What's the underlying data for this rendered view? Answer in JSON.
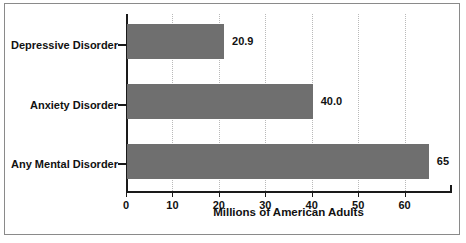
{
  "chart_data": {
    "type": "bar",
    "orientation": "horizontal",
    "title": "",
    "xlabel": "Millions of American Adults",
    "ylabel": "",
    "categories": [
      "Depressive Disorder",
      "Anxiety Disorder",
      "Any Mental Disorder"
    ],
    "values": [
      20.9,
      40.0,
      65
    ],
    "value_labels": [
      "20.9",
      "40.0",
      "65"
    ],
    "xlim": [
      0,
      70
    ],
    "xticks": [
      0,
      10,
      20,
      30,
      40,
      50,
      60
    ],
    "xticklabels": [
      "0",
      "10",
      "20",
      "30",
      "40",
      "50",
      "60"
    ],
    "grid": "vertical-dotted",
    "legend": "none",
    "bar_color": "#6f6f6f",
    "axis_color": "#1a1a1a",
    "gridline_color": "#b9b9b9",
    "background_color": "#ffffff",
    "frame_color": "#8a8a8a"
  }
}
